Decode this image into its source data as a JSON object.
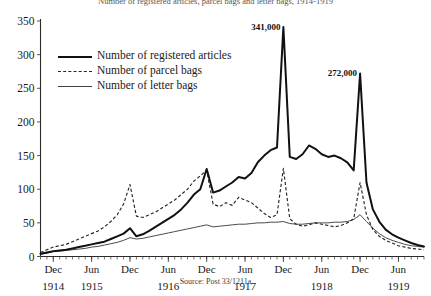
{
  "chart_data": {
    "type": "line",
    "title": "Number of registered articles, parcel bags and letter bags, 1914-1919",
    "xlabel": "",
    "ylabel": "",
    "ylim": [
      0,
      350
    ],
    "yticks": [
      0,
      50,
      100,
      150,
      200,
      250,
      300,
      350
    ],
    "grid": false,
    "legend_position": "upper-left",
    "source": "Source: Post 33/1211a",
    "x_tick_labels": [
      "Dec",
      "Jun",
      "Dec",
      "Jun",
      "Dec",
      "Jun",
      "Dec",
      "Jun",
      "Dec",
      "Jun"
    ],
    "x_year_labels": [
      "1914",
      "1915",
      "1916",
      "1917",
      "1918",
      "1919"
    ],
    "x_months": [
      "1914-10",
      "1914-11",
      "1914-12",
      "1915-01",
      "1915-02",
      "1915-03",
      "1915-04",
      "1915-05",
      "1915-06",
      "1915-07",
      "1915-08",
      "1915-09",
      "1915-10",
      "1915-11",
      "1915-12",
      "1916-01",
      "1916-02",
      "1916-03",
      "1916-04",
      "1916-05",
      "1916-06",
      "1916-07",
      "1916-08",
      "1916-09",
      "1916-10",
      "1916-11",
      "1916-12",
      "1917-01",
      "1917-02",
      "1917-03",
      "1917-04",
      "1917-05",
      "1917-06",
      "1917-07",
      "1917-08",
      "1917-09",
      "1917-10",
      "1917-11",
      "1917-12",
      "1918-01",
      "1918-02",
      "1918-03",
      "1918-04",
      "1918-05",
      "1918-06",
      "1918-07",
      "1918-08",
      "1918-09",
      "1918-10",
      "1918-11",
      "1918-12",
      "1919-01",
      "1919-02",
      "1919-03",
      "1919-04",
      "1919-05",
      "1919-06",
      "1919-07",
      "1919-08",
      "1919-09",
      "1919-10"
    ],
    "series": [
      {
        "name": "Number of registered articles",
        "style": "solid-thick",
        "values": [
          4,
          6,
          8,
          9,
          10,
          12,
          14,
          16,
          18,
          20,
          22,
          26,
          30,
          34,
          42,
          30,
          33,
          38,
          44,
          50,
          56,
          62,
          70,
          80,
          92,
          100,
          130,
          95,
          98,
          104,
          110,
          118,
          116,
          124,
          140,
          150,
          158,
          162,
          341,
          148,
          145,
          152,
          165,
          160,
          152,
          148,
          150,
          146,
          140,
          128,
          272,
          110,
          70,
          52,
          40,
          33,
          28,
          24,
          20,
          17,
          15
        ]
      },
      {
        "name": "Number of parcel bags",
        "style": "dashed",
        "values": [
          6,
          10,
          14,
          16,
          18,
          22,
          26,
          30,
          34,
          38,
          44,
          52,
          62,
          78,
          107,
          60,
          58,
          62,
          66,
          72,
          78,
          84,
          92,
          100,
          112,
          120,
          128,
          78,
          74,
          80,
          76,
          88,
          84,
          80,
          72,
          64,
          58,
          62,
          131,
          56,
          48,
          45,
          47,
          50,
          48,
          46,
          44,
          46,
          50,
          56,
          110,
          62,
          40,
          30,
          24,
          20,
          16,
          14,
          12,
          11,
          10
        ]
      },
      {
        "name": "Number of letter bags",
        "style": "solid-thin",
        "values": [
          3,
          5,
          7,
          8,
          9,
          10,
          11,
          12,
          14,
          15,
          17,
          19,
          21,
          24,
          28,
          26,
          27,
          29,
          31,
          33,
          35,
          37,
          39,
          41,
          43,
          45,
          47,
          44,
          45,
          46,
          47,
          48,
          48,
          49,
          50,
          50,
          51,
          51,
          52,
          49,
          48,
          48,
          49,
          50,
          50,
          50,
          51,
          51,
          52,
          55,
          62,
          52,
          42,
          34,
          28,
          24,
          21,
          18,
          16,
          15,
          14
        ]
      }
    ],
    "annotations": [
      {
        "label": "341,000",
        "value": 341,
        "x_month": "1917-12"
      },
      {
        "label": "272,000",
        "value": 272,
        "x_month": "1918-12"
      }
    ]
  }
}
